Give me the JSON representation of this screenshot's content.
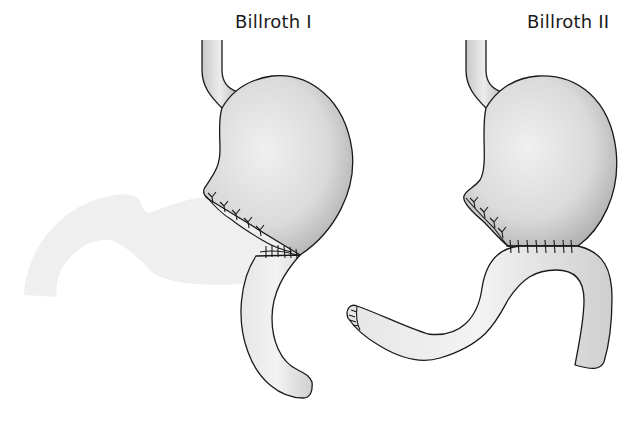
{
  "diagram": {
    "type": "medical-illustration",
    "panels": [
      {
        "title": "Billroth I",
        "parts": [
          "esophagus",
          "gastric-remnant",
          "removed-distal-stomach-ghost",
          "gastroduodenal-anastomosis",
          "duodenum"
        ]
      },
      {
        "title": "Billroth II",
        "parts": [
          "esophagus",
          "gastric-remnant",
          "closed-duodenal-stump",
          "gastrojejunal-anastomosis",
          "jejunal-loop"
        ]
      }
    ],
    "colors": {
      "outline": "#1a1a1a",
      "organ_fill": "#dcdcdc",
      "organ_shade": "#b8b8b8",
      "ghost_fill": "#efefef",
      "background": "#ffffff"
    }
  }
}
